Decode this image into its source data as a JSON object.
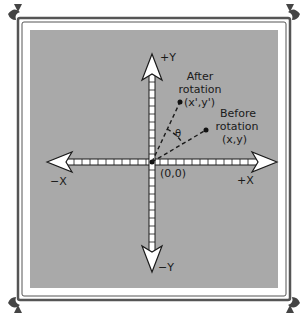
{
  "diagram": {
    "colors": {
      "panel_bg": "#a9a9a9",
      "frame": "#555555",
      "axis_fill": "#ffffff",
      "axis_stroke": "#1a1a1a",
      "text": "#1a1a1a"
    },
    "axes": {
      "pos_y_label": "+Y",
      "neg_y_label": "−Y",
      "pos_x_label": "+X",
      "neg_x_label": "−X",
      "origin_label": "(0,0)"
    },
    "points": {
      "after": {
        "line1": "After",
        "line2": "rotation",
        "coord": "(x',y')"
      },
      "before": {
        "line1": "Before",
        "line2": "rotation",
        "coord": "(x,y)"
      }
    },
    "angle_label": "θ"
  }
}
